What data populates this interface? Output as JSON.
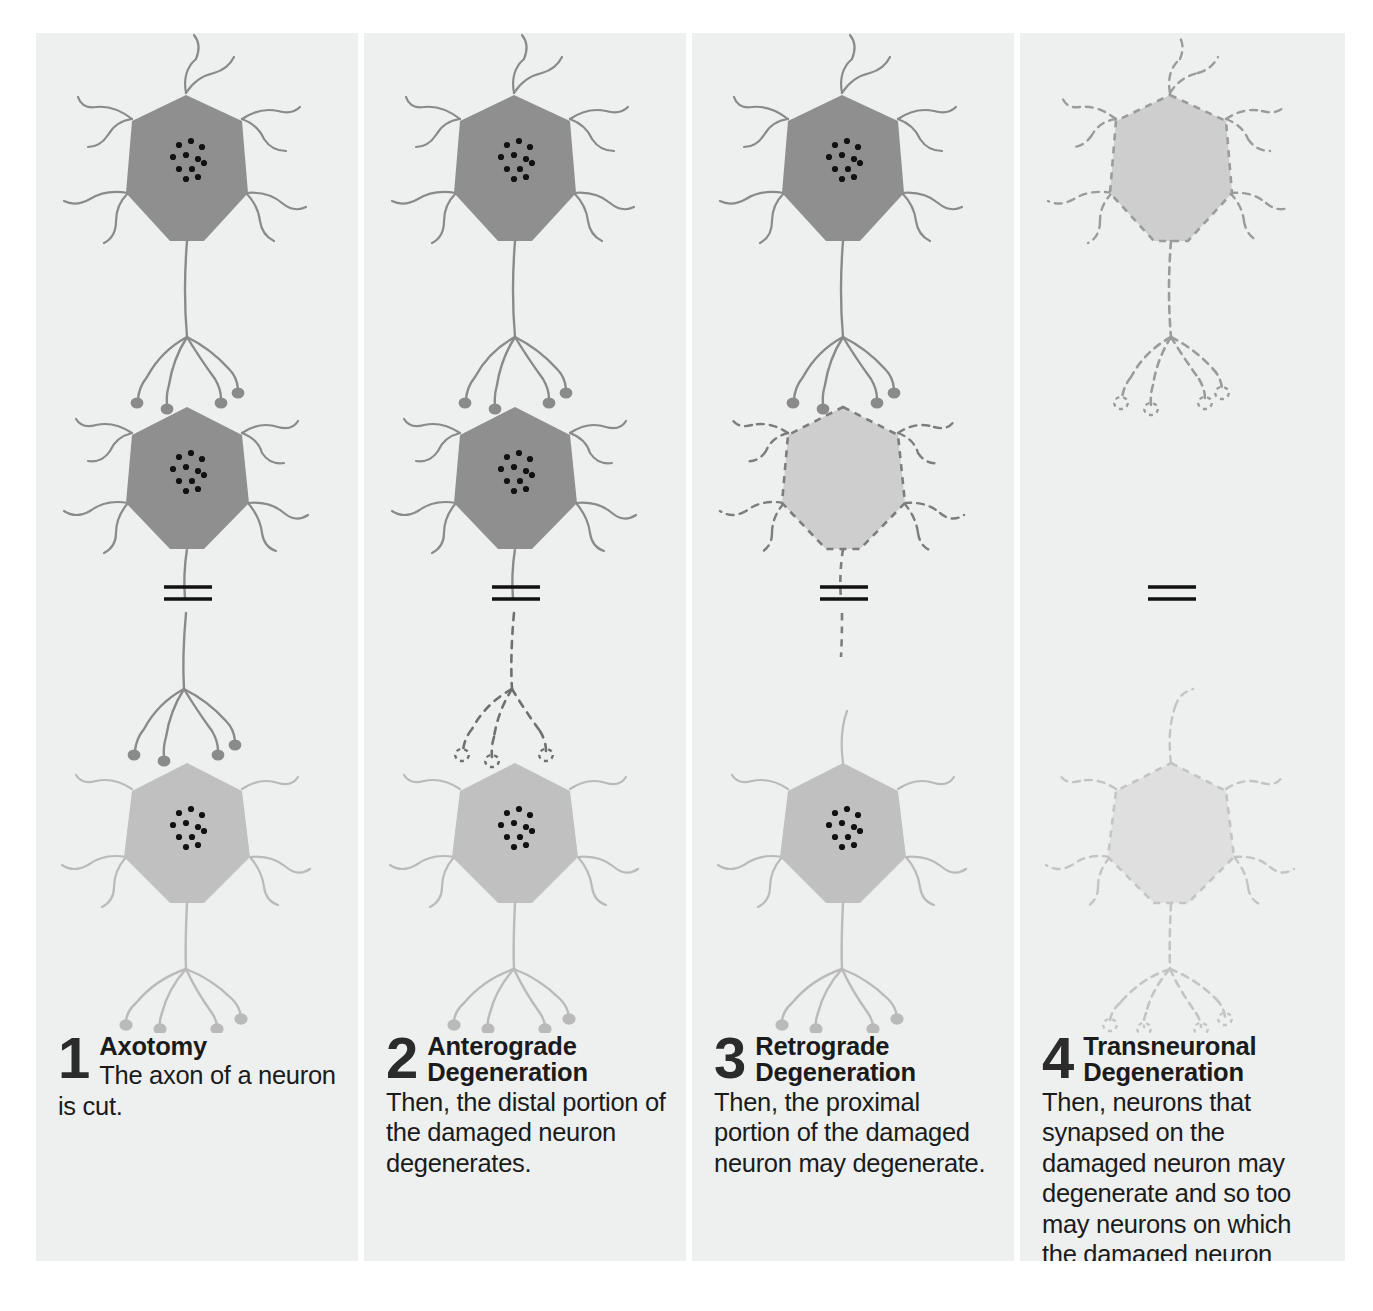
{
  "figure": {
    "background_color": "#ffffff",
    "panel_background_color": "#eef0ef",
    "healthy_dark_soma_color": "#8f8f8f",
    "healthy_light_soma_color": "#bfc0bf",
    "degenerating_soma_color": "#cdcecd",
    "faded_soma_color": "#dedfde",
    "process_dark_color": "#8a8a8a",
    "process_light_color": "#b9bab9",
    "process_faded_color": "#cfd0cf",
    "nucleus_dot_color": "#111111",
    "cut_mark_color": "#111111"
  },
  "panels": [
    {
      "number": "1",
      "title_lines": [
        "Axotomy"
      ],
      "body": "The axon of a neuron is cut.",
      "neurons": {
        "top": "healthy-dark",
        "middle": "healthy-dark",
        "bottom": "healthy-light"
      },
      "axon_distal_state": "intact",
      "cut_mark": true
    },
    {
      "number": "2",
      "title_lines": [
        "Anterograde",
        "Degeneration"
      ],
      "body": "Then, the distal portion of the damaged neuron degenerates.",
      "neurons": {
        "top": "healthy-dark",
        "middle": "healthy-dark",
        "bottom": "healthy-light"
      },
      "axon_distal_state": "degenerating",
      "cut_mark": true
    },
    {
      "number": "3",
      "title_lines": [
        "Retrograde",
        "Degeneration"
      ],
      "body": "Then, the proximal portion of the damaged neuron may degenerate.",
      "neurons": {
        "top": "healthy-dark",
        "middle": "degenerating",
        "bottom": "healthy-light"
      },
      "axon_distal_state": "absent",
      "cut_mark": true
    },
    {
      "number": "4",
      "title_lines": [
        "Transneuronal",
        "Degeneration"
      ],
      "body": "Then, neurons that synapsed on the damaged neuron may degenerate and so too may neurons on which the damaged neuron synapsed.",
      "neurons": {
        "top": "degenerating",
        "middle": "absent",
        "bottom": "degenerating-faded"
      },
      "axon_distal_state": "absent",
      "cut_mark": true
    }
  ]
}
